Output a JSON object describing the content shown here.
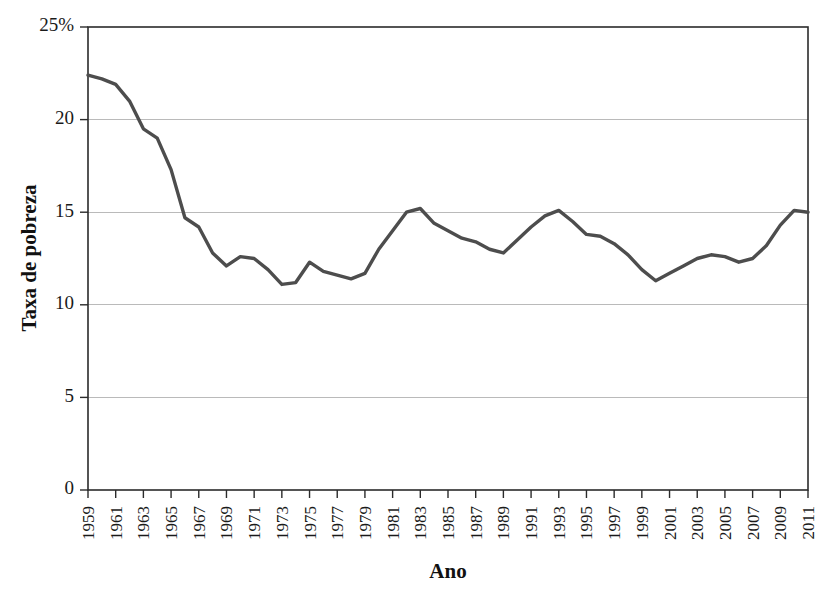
{
  "chart_data": {
    "type": "line",
    "title": "",
    "xlabel": "Ano",
    "ylabel": "Taxa de pobreza",
    "xlim": [
      1959,
      2011
    ],
    "ylim": [
      0,
      25
    ],
    "grid": true,
    "legend": false,
    "legend_position": "none",
    "line_color": "#4d4d4d",
    "y_ticks": [
      0,
      5,
      10,
      15,
      20,
      25
    ],
    "y_tick_labels": [
      "0",
      "5",
      "10",
      "15",
      "20",
      "25%"
    ],
    "x_ticks": [
      1959,
      1961,
      1963,
      1965,
      1967,
      1969,
      1971,
      1973,
      1975,
      1977,
      1979,
      1981,
      1983,
      1985,
      1987,
      1989,
      1991,
      1993,
      1995,
      1997,
      1999,
      2001,
      2003,
      2005,
      2007,
      2009,
      2011
    ],
    "x_tick_labels": [
      "1959",
      "1961",
      "1963",
      "1965",
      "1967",
      "1969",
      "1971",
      "1973",
      "1975",
      "1977",
      "1979",
      "1981",
      "1983",
      "1985",
      "1987",
      "1989",
      "1991",
      "1993",
      "1995",
      "1997",
      "1999",
      "2001",
      "2003",
      "2005",
      "2007",
      "2009",
      "2011"
    ],
    "x": [
      1959,
      1960,
      1961,
      1962,
      1963,
      1964,
      1965,
      1966,
      1967,
      1968,
      1969,
      1970,
      1971,
      1972,
      1973,
      1974,
      1975,
      1976,
      1977,
      1978,
      1979,
      1980,
      1981,
      1982,
      1983,
      1984,
      1985,
      1986,
      1987,
      1988,
      1989,
      1990,
      1991,
      1992,
      1993,
      1994,
      1995,
      1996,
      1997,
      1998,
      1999,
      2000,
      2001,
      2002,
      2003,
      2004,
      2005,
      2006,
      2007,
      2008,
      2009,
      2010,
      2011
    ],
    "values": [
      22.4,
      22.2,
      21.9,
      21.0,
      19.5,
      19.0,
      17.3,
      14.7,
      14.2,
      12.8,
      12.1,
      12.6,
      12.5,
      11.9,
      11.1,
      11.2,
      12.3,
      11.8,
      11.6,
      11.4,
      11.7,
      13.0,
      14.0,
      15.0,
      15.2,
      14.4,
      14.0,
      13.6,
      13.4,
      13.0,
      12.8,
      13.5,
      14.2,
      14.8,
      15.1,
      14.5,
      13.8,
      13.7,
      13.3,
      12.7,
      11.9,
      11.3,
      11.7,
      12.1,
      12.5,
      12.7,
      12.6,
      12.3,
      12.5,
      13.2,
      14.3,
      15.1,
      15.0
    ],
    "annotations": []
  },
  "axis": {
    "y_title": "Taxa de pobreza",
    "x_title": "Ano"
  }
}
